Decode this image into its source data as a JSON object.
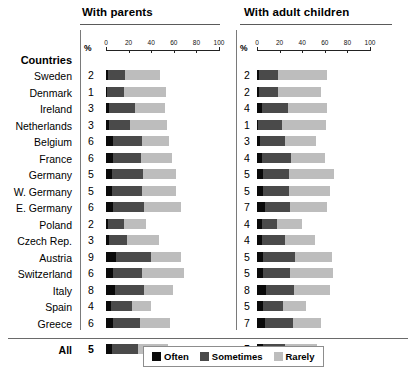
{
  "panels": [
    {
      "title": "With parents",
      "axis_unit": "%"
    },
    {
      "title": "With adult children",
      "axis_unit": "%"
    }
  ],
  "countries_heading": "Countries",
  "legend": {
    "items": [
      {
        "label": "Often",
        "color": "#0a0a0a"
      },
      {
        "label": "Sometimes",
        "color": "#4a4a4a"
      },
      {
        "label": "Rarely",
        "color": "#bdbdbd"
      }
    ]
  },
  "axis": {
    "ticks": [
      0,
      20,
      40,
      60,
      80,
      100
    ],
    "min": 0,
    "max": 100
  },
  "chart_data": {
    "type": "bar",
    "subtype": "stacked-horizontal",
    "xlabel": "%",
    "ylabel": "Countries",
    "xlim": [
      0,
      100
    ],
    "xticks": [
      0,
      20,
      40,
      60,
      80,
      100
    ],
    "grid": false,
    "legend_position": "bottom-center",
    "legend_entries": [
      "Often",
      "Sometimes",
      "Rarely"
    ],
    "categories": [
      "Sweden",
      "Denmark",
      "Ireland",
      "Netherlands",
      "Belgium",
      "France",
      "Germany",
      "W. Germany",
      "E. Germany",
      "Poland",
      "Czech Rep.",
      "Austria",
      "Switzerland",
      "Italy",
      "Spain",
      "Greece",
      "All"
    ],
    "panels": [
      {
        "name": "With parents",
        "series": [
          {
            "name": "Often",
            "values": [
              2,
              1,
              3,
              3,
              6,
              6,
              5,
              5,
              6,
              2,
              3,
              9,
              6,
              8,
              4,
              6,
              5
            ]
          },
          {
            "name": "Sometimes",
            "values": [
              15,
              15,
              23,
              18,
              26,
              25,
              28,
              27,
              28,
              14,
              16,
              31,
              26,
              26,
              19,
              24,
              23
            ]
          },
          {
            "name": "Rarely",
            "values": [
              31,
              37,
              26,
              33,
              24,
              27,
              29,
              30,
              32,
              19,
              28,
              26,
              37,
              25,
              17,
              27,
              27
            ]
          }
        ],
        "totals": [
          48,
          53,
          52,
          54,
          56,
          58,
          62,
          62,
          66,
          35,
          47,
          66,
          69,
          59,
          40,
          57,
          55
        ],
        "value_labels": [
          2,
          1,
          3,
          3,
          6,
          6,
          5,
          5,
          6,
          2,
          3,
          9,
          6,
          8,
          4,
          6,
          5
        ]
      },
      {
        "name": "With adult children",
        "series": [
          {
            "name": "Often",
            "values": [
              2,
              2,
              4,
              1,
              3,
              4,
              5,
              5,
              7,
              4,
              4,
              5,
              5,
              8,
              5,
              7,
              5
            ]
          },
          {
            "name": "Sometimes",
            "values": [
              17,
              17,
              23,
              21,
              22,
              26,
              23,
              23,
              22,
              14,
              21,
              29,
              24,
              25,
              18,
              25,
              20
            ]
          },
          {
            "name": "Rarely",
            "values": [
              43,
              38,
              35,
              39,
              27,
              30,
              40,
              37,
              33,
              22,
              26,
              32,
              38,
              32,
              20,
              25,
              28
            ]
          }
        ],
        "totals": [
          62,
          57,
          62,
          61,
          52,
          60,
          68,
          65,
          62,
          40,
          51,
          66,
          67,
          65,
          43,
          57,
          53
        ],
        "value_labels": [
          2,
          2,
          4,
          1,
          3,
          4,
          5,
          5,
          7,
          4,
          4,
          5,
          5,
          8,
          5,
          7,
          5
        ]
      }
    ]
  }
}
